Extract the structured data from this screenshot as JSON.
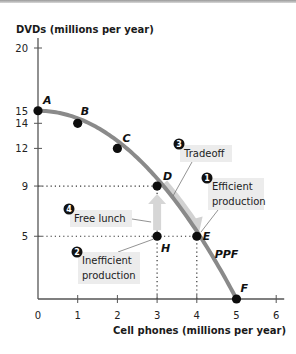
{
  "chart_data": {
    "type": "line",
    "title": "",
    "xlabel": "Cell phones (millions per year)",
    "ylabel": "DVDs (millions per year)",
    "xlim": [
      0,
      6
    ],
    "ylim": [
      0,
      20
    ],
    "x_ticks": [
      0,
      1,
      2,
      3,
      4,
      5,
      6
    ],
    "y_ticks": [
      5,
      9,
      12,
      14,
      15,
      20
    ],
    "grid": false,
    "series": [
      {
        "name": "PPF",
        "points": [
          {
            "label": "A",
            "x": 0,
            "y": 15
          },
          {
            "label": "B",
            "x": 1,
            "y": 14
          },
          {
            "label": "C",
            "x": 2,
            "y": 12
          },
          {
            "label": "D",
            "x": 3,
            "y": 9
          },
          {
            "label": "E",
            "x": 4,
            "y": 5
          },
          {
            "label": "F",
            "x": 5,
            "y": 0
          }
        ]
      }
    ],
    "extra_points": [
      {
        "label": "H",
        "x": 3,
        "y": 5
      }
    ],
    "curve_label": "PPF",
    "guides": [
      {
        "from": [
          0,
          9
        ],
        "to": [
          3,
          9
        ]
      },
      {
        "from": [
          0,
          5
        ],
        "to": [
          4,
          5
        ]
      },
      {
        "from": [
          3,
          0
        ],
        "to": [
          3,
          9
        ]
      },
      {
        "from": [
          4,
          0
        ],
        "to": [
          4,
          5
        ]
      }
    ],
    "arrows": [
      {
        "name": "free-lunch-arrow",
        "from": [
          3,
          5
        ],
        "to": [
          3,
          9
        ]
      },
      {
        "name": "tradeoff-arrow",
        "from": [
          3,
          9
        ],
        "to": [
          4,
          5
        ]
      }
    ],
    "annotations": [
      {
        "number": "1",
        "text": [
          "Efficient",
          "production"
        ]
      },
      {
        "number": "2",
        "text": [
          "Inefficient",
          "production"
        ]
      },
      {
        "number": "3",
        "text": [
          "Tradeoff"
        ]
      },
      {
        "number": "4",
        "text": [
          "Free lunch"
        ]
      }
    ]
  }
}
